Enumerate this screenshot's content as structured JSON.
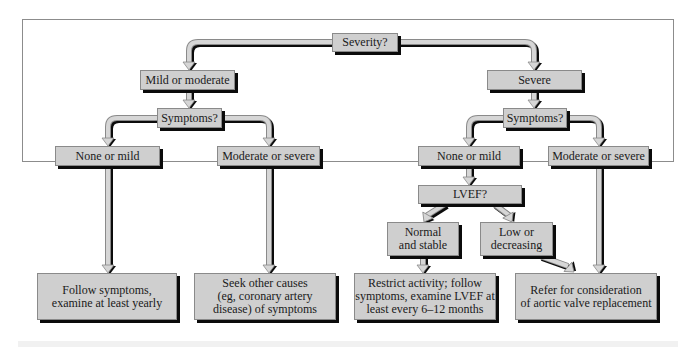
{
  "diagram": {
    "type": "flowchart",
    "colors": {
      "box_fill": "#cfcfcf",
      "box_border": "#8a8a8a",
      "shadow": "#0b0b0b",
      "arrow_fill": "#d6d6d6",
      "frame": "#8c8c8c"
    },
    "nodes": {
      "severity": "Severity?",
      "mild_moderate": "Mild or moderate",
      "severe": "Severe",
      "symptoms_left": "Symptoms?",
      "symptoms_right": "Symptoms?",
      "left_none_mild": "None or mild",
      "left_mod_severe": "Moderate or severe",
      "right_none_mild": "None or mild",
      "right_mod_severe": "Moderate or severe",
      "lvef": "LVEF?",
      "normal_stable": "Normal\nand stable",
      "low_decreasing": "Low or\ndecreasing",
      "follow_symptoms": "Follow symptoms,\nexamine at least yearly",
      "seek_other_causes": "Seek other causes\n(eg, coronary artery\ndisease) of symptoms",
      "restrict_activity": "Restrict activity; follow\nsymptoms, examine LVEF at\nleast every 6–12 months",
      "refer_avr": "Refer for consideration\nof aortic valve replacement"
    },
    "edges": [
      {
        "from": "severity",
        "to": "mild_moderate"
      },
      {
        "from": "severity",
        "to": "severe"
      },
      {
        "from": "mild_moderate",
        "to": "symptoms_left"
      },
      {
        "from": "symptoms_left",
        "to": "left_none_mild"
      },
      {
        "from": "symptoms_left",
        "to": "left_mod_severe"
      },
      {
        "from": "left_none_mild",
        "to": "follow_symptoms"
      },
      {
        "from": "left_mod_severe",
        "to": "seek_other_causes"
      },
      {
        "from": "severe",
        "to": "symptoms_right"
      },
      {
        "from": "symptoms_right",
        "to": "right_none_mild"
      },
      {
        "from": "symptoms_right",
        "to": "right_mod_severe"
      },
      {
        "from": "right_none_mild",
        "to": "lvef"
      },
      {
        "from": "lvef",
        "to": "normal_stable"
      },
      {
        "from": "lvef",
        "to": "low_decreasing"
      },
      {
        "from": "normal_stable",
        "to": "restrict_activity"
      },
      {
        "from": "low_decreasing",
        "to": "refer_avr"
      },
      {
        "from": "right_mod_severe",
        "to": "refer_avr"
      }
    ]
  }
}
